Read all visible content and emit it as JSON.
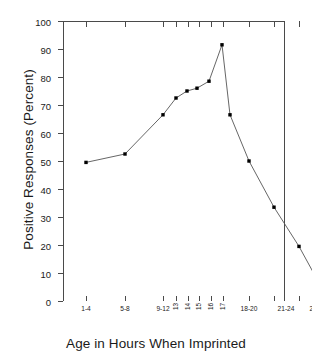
{
  "chart_data": {
    "type": "line",
    "title": "",
    "xlabel": "Age in Hours When Imprinted",
    "ylabel": "Positive Responses (Percent)",
    "ylim": [
      0,
      100
    ],
    "ytick_labels": [
      "0",
      "10",
      "20",
      "30",
      "40",
      "50",
      "60",
      "70",
      "80",
      "90",
      "100"
    ],
    "ytick_values": [
      0,
      10,
      20,
      30,
      40,
      50,
      60,
      70,
      80,
      90,
      100
    ],
    "grid": false,
    "legend": null,
    "marker": "filled-square",
    "line_color": "#555555",
    "marker_color": "#000000",
    "categories": [
      "1-4",
      "5-8",
      "9-12",
      "13",
      "14",
      "15",
      "16",
      "17",
      "17",
      "18-20",
      "21-24",
      "25-28",
      "29-32"
    ],
    "xtick_labels": [
      "1-4",
      "5-8",
      "9-12",
      "13",
      "14",
      "15",
      "16",
      "17",
      "18-20",
      "21-24",
      "25-28",
      "29-32"
    ],
    "values": [
      49.5,
      52.5,
      66.5,
      72.5,
      75.0,
      76.0,
      78.5,
      91.5,
      66.5,
      50.0,
      33.5,
      19.5,
      4.5
    ],
    "points": [
      {
        "label": "1-4",
        "x": 1,
        "y": 49.5
      },
      {
        "label": "5-8",
        "x": 2,
        "y": 52.5
      },
      {
        "label": "9-12",
        "x": 3,
        "y": 66.5
      },
      {
        "label": "13",
        "x": 4,
        "y": 72.5
      },
      {
        "label": "14",
        "x": 5,
        "y": 75.0
      },
      {
        "label": "15",
        "x": 6,
        "y": 76.0
      },
      {
        "label": "16",
        "x": 7,
        "y": 78.5
      },
      {
        "label": "17",
        "x": 8,
        "y": 91.5
      },
      {
        "label": "17",
        "x": 9,
        "y": 66.5
      },
      {
        "label": "18-20",
        "x": 10,
        "y": 50.0
      },
      {
        "label": "21-24",
        "x": 11,
        "y": 33.5
      },
      {
        "label": "25-28",
        "x": 12,
        "y": 19.5
      },
      {
        "label": "29-32",
        "x": 13,
        "y": 4.5
      }
    ]
  }
}
